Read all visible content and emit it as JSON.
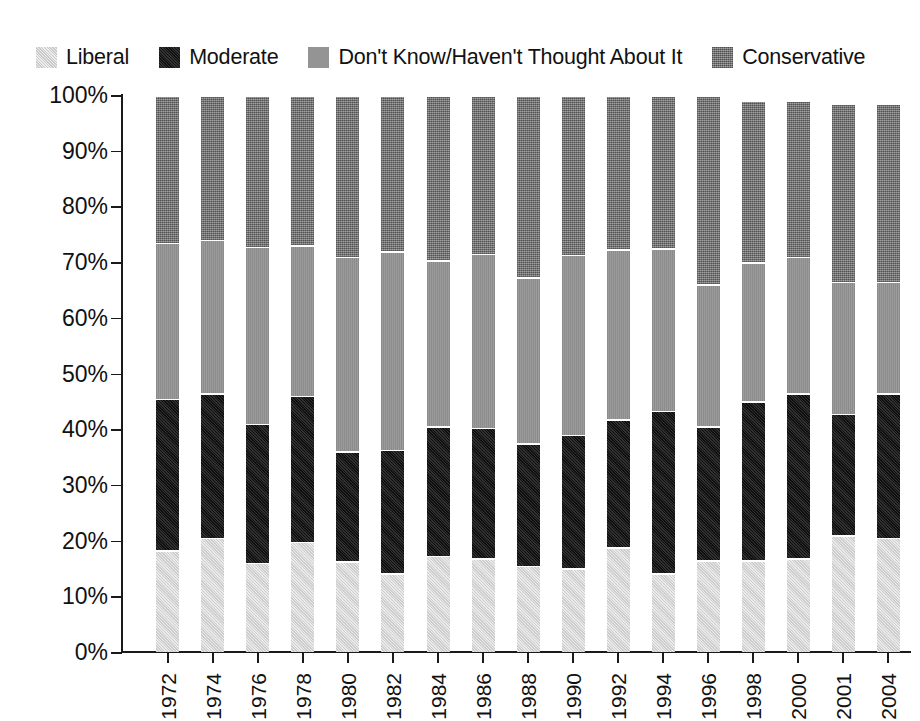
{
  "legend": {
    "items": [
      {
        "label": "Liberal",
        "key": "liberal",
        "color": "#d9d9d9",
        "swatch": "legend-swatch-liberal"
      },
      {
        "label": "Moderate",
        "key": "moderate",
        "color": "#1c1c1c",
        "swatch": "legend-swatch-moderate"
      },
      {
        "label": "Don't Know/Haven't Thought About It",
        "key": "dont_know",
        "color": "#949494",
        "swatch": "legend-swatch-dont-know"
      },
      {
        "label": "Conservative",
        "key": "conservative",
        "color": "#7d7d7d",
        "swatch": "legend-swatch-conservative"
      }
    ]
  },
  "chart_data": {
    "type": "bar",
    "subtype": "stacked-bar-100-percent",
    "title": "",
    "subtitle": "",
    "xlabel": "",
    "ylabel": "",
    "ylim": [
      0,
      100
    ],
    "yticks": [
      0,
      10,
      20,
      30,
      40,
      50,
      60,
      70,
      80,
      90,
      100
    ],
    "ytick_labels": [
      "0%",
      "10%",
      "20%",
      "30%",
      "40%",
      "50%",
      "60%",
      "70%",
      "80%",
      "90%",
      "100%"
    ],
    "grid": false,
    "legend_position": "top-left",
    "categories": [
      "1972",
      "1974",
      "1976",
      "1978",
      "1980",
      "1982",
      "1984",
      "1986",
      "1988",
      "1990",
      "1992",
      "1994",
      "1996",
      "1998",
      "2000",
      "2001",
      "2004"
    ],
    "series": [
      {
        "name": "Liberal",
        "color": "#d9d9d9",
        "values": [
          18.3,
          20.5,
          16.0,
          19.8,
          16.3,
          14.2,
          17.3,
          16.8,
          15.5,
          15.0,
          18.8,
          14.2,
          16.5,
          16.5,
          16.8,
          21.0,
          20.5
        ]
      },
      {
        "name": "Moderate",
        "color": "#1c1c1c",
        "values": [
          27.2,
          26.0,
          25.0,
          26.2,
          19.7,
          22.1,
          23.2,
          23.5,
          22.0,
          24.0,
          23.0,
          29.1,
          24.0,
          28.5,
          29.7,
          21.8,
          26.0
        ]
      },
      {
        "name": "Don't Know/Haven't Thought About It",
        "color": "#949494",
        "values": [
          28.0,
          27.5,
          31.8,
          27.0,
          35.0,
          35.7,
          29.8,
          31.2,
          29.8,
          32.3,
          30.5,
          29.2,
          25.5,
          25.0,
          24.5,
          23.7,
          20.0
        ]
      },
      {
        "name": "Conservative",
        "color": "#7d7d7d",
        "values": [
          26.5,
          26.0,
          27.2,
          27.0,
          29.0,
          28.0,
          29.7,
          28.5,
          32.7,
          28.7,
          27.7,
          27.5,
          34.0,
          29.0,
          28.0,
          32.0,
          32.0
        ]
      }
    ],
    "cumulative_tops": {
      "note": "running top edge of each segment, percent",
      "liberal": [
        18.3,
        20.5,
        16.0,
        19.8,
        16.3,
        14.2,
        17.3,
        16.8,
        15.5,
        15.0,
        18.8,
        14.2,
        16.5,
        16.5,
        16.8,
        21.0,
        20.5
      ],
      "moderate": [
        45.5,
        46.5,
        41.0,
        46.0,
        36.0,
        36.3,
        40.5,
        40.3,
        37.5,
        39.0,
        41.8,
        43.3,
        40.5,
        45.0,
        46.5,
        42.8,
        46.5
      ],
      "dont_know": [
        73.5,
        74.0,
        72.8,
        73.0,
        71.0,
        72.0,
        70.3,
        71.5,
        67.3,
        71.3,
        72.3,
        72.5,
        66.0,
        70.0,
        71.0,
        66.5,
        66.5
      ],
      "conservative": [
        100.0,
        100.0,
        100.0,
        100.0,
        100.0,
        100.0,
        100.0,
        100.0,
        100.0,
        100.0,
        100.0,
        100.0,
        100.0,
        99.0,
        99.0,
        98.5,
        98.5
      ]
    }
  }
}
